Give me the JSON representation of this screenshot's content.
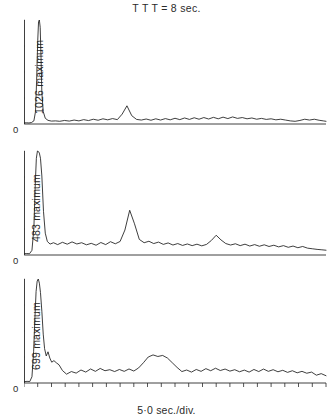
{
  "figure": {
    "title": "T T T = 8 sec.",
    "xlabel": "5·0 sec./div.",
    "zero_label": "0",
    "line_color": "#1c1c1c",
    "background_color": "#ffffff",
    "axis_color": "#2a2a2a"
  },
  "panels": [
    {
      "ylabel": "1026 maximum",
      "maximum": 1026,
      "zero_label": "0"
    },
    {
      "ylabel": "483 maximum",
      "maximum": 483,
      "zero_label": "0"
    },
    {
      "ylabel": "699 maximum",
      "maximum": 699,
      "zero_label": "0"
    }
  ],
  "chart_data": {
    "type": "line",
    "title": "T T T = 8 sec.",
    "xlabel": "5·0 sec./div.",
    "ylabel": "maximum",
    "grid": false,
    "legend": "none",
    "x_tick_interval_seconds": 5.0,
    "x_axis_ticks": 22,
    "y_axis_ticks": 5,
    "xlim": [
      0,
      22
    ],
    "ylim": [
      0,
      1
    ],
    "note": "Three stacked traces; y values normalised 0-1 of each panel maximum",
    "series": [
      {
        "name": "1026 maximum",
        "maximum": 1026,
        "ylabel": "1026 maximum",
        "x": [
          0.0,
          0.18,
          0.36,
          0.54,
          0.72,
          0.84,
          0.92,
          1.0,
          1.06,
          1.12,
          1.18,
          1.24,
          1.3,
          1.4,
          1.55,
          1.75,
          2.0,
          2.3,
          2.6,
          2.95,
          3.3,
          3.65,
          4.0,
          4.35,
          4.7,
          5.05,
          5.4,
          5.75,
          6.1,
          6.45,
          6.8,
          7.15,
          7.5,
          7.85,
          8.2,
          8.55,
          8.9,
          9.25,
          9.6,
          9.95,
          10.3,
          10.65,
          11.0,
          11.35,
          11.7,
          12.05,
          12.4,
          12.75,
          13.1,
          13.45,
          13.8,
          14.15,
          14.5,
          14.85,
          15.2,
          15.55,
          15.9,
          16.25,
          16.6,
          16.95,
          17.3,
          17.65,
          18.0,
          18.35,
          18.7,
          19.05,
          19.4,
          19.75,
          20.1,
          20.45,
          20.8,
          21.15,
          21.5,
          21.8,
          22.0
        ],
        "y": [
          0.01,
          0.012,
          0.01,
          0.014,
          0.03,
          0.12,
          0.42,
          0.8,
          0.985,
          1.0,
          0.93,
          0.64,
          0.3,
          0.12,
          0.055,
          0.035,
          0.028,
          0.03,
          0.026,
          0.034,
          0.028,
          0.038,
          0.03,
          0.042,
          0.033,
          0.046,
          0.036,
          0.05,
          0.04,
          0.052,
          0.042,
          0.095,
          0.175,
          0.08,
          0.044,
          0.038,
          0.048,
          0.036,
          0.05,
          0.038,
          0.052,
          0.04,
          0.055,
          0.042,
          0.058,
          0.044,
          0.06,
          0.046,
          0.062,
          0.048,
          0.064,
          0.05,
          0.066,
          0.052,
          0.068,
          0.054,
          0.062,
          0.05,
          0.058,
          0.046,
          0.054,
          0.044,
          0.05,
          0.04,
          0.046,
          0.038,
          0.03,
          0.026,
          0.034,
          0.046,
          0.038,
          0.046,
          0.036,
          0.03,
          0.026
        ]
      },
      {
        "name": "483 maximum",
        "maximum": 483,
        "ylabel": "483 maximum",
        "x": [
          0.0,
          0.2,
          0.4,
          0.58,
          0.72,
          0.82,
          0.9,
          0.98,
          1.05,
          1.12,
          1.2,
          1.3,
          1.42,
          1.55,
          1.7,
          1.9,
          2.15,
          2.45,
          2.8,
          3.15,
          3.5,
          3.85,
          4.2,
          4.55,
          4.9,
          5.25,
          5.6,
          5.95,
          6.3,
          6.65,
          7.0,
          7.35,
          7.7,
          8.05,
          8.4,
          8.75,
          9.1,
          9.45,
          9.8,
          10.15,
          10.5,
          10.85,
          11.2,
          11.55,
          11.9,
          12.25,
          12.6,
          12.95,
          13.3,
          13.65,
          14.0,
          14.35,
          14.7,
          15.05,
          15.4,
          15.75,
          16.1,
          16.45,
          16.8,
          17.15,
          17.5,
          17.85,
          18.2,
          18.55,
          18.9,
          19.25,
          19.6,
          19.95,
          20.3,
          20.65,
          21.0,
          21.35,
          21.7,
          22.0
        ],
        "y": [
          0.012,
          0.014,
          0.012,
          0.045,
          0.26,
          0.68,
          0.93,
          1.0,
          0.995,
          0.98,
          0.93,
          0.76,
          0.42,
          0.21,
          0.13,
          0.105,
          0.118,
          0.1,
          0.122,
          0.104,
          0.126,
          0.106,
          0.118,
          0.098,
          0.112,
          0.094,
          0.12,
          0.1,
          0.128,
          0.108,
          0.13,
          0.24,
          0.43,
          0.3,
          0.15,
          0.118,
          0.132,
          0.11,
          0.124,
          0.102,
          0.116,
          0.096,
          0.11,
          0.092,
          0.106,
          0.09,
          0.104,
          0.088,
          0.102,
          0.14,
          0.19,
          0.145,
          0.11,
          0.096,
          0.108,
          0.09,
          0.104,
          0.086,
          0.1,
          0.084,
          0.098,
          0.082,
          0.094,
          0.078,
          0.09,
          0.074,
          0.086,
          0.07,
          0.082,
          0.066,
          0.06,
          0.054,
          0.05,
          0.046
        ]
      },
      {
        "name": "699 maximum",
        "maximum": 699,
        "ylabel": "699 maximum",
        "x": [
          0.0,
          0.22,
          0.42,
          0.58,
          0.7,
          0.8,
          0.88,
          0.96,
          1.04,
          1.12,
          1.2,
          1.3,
          1.4,
          1.5,
          1.62,
          1.75,
          1.88,
          2.02,
          2.18,
          2.35,
          2.55,
          2.8,
          3.1,
          3.45,
          3.8,
          4.15,
          4.5,
          4.85,
          5.2,
          5.55,
          5.9,
          6.25,
          6.6,
          6.95,
          7.3,
          7.65,
          8.0,
          8.35,
          8.7,
          9.05,
          9.4,
          9.75,
          10.1,
          10.45,
          10.8,
          11.15,
          11.5,
          11.85,
          12.2,
          12.55,
          12.9,
          13.25,
          13.6,
          13.95,
          14.3,
          14.65,
          15.0,
          15.35,
          15.7,
          16.05,
          16.4,
          16.75,
          17.1,
          17.45,
          17.8,
          18.15,
          18.5,
          18.85,
          19.2,
          19.55,
          19.9,
          20.25,
          20.6,
          20.95,
          21.3,
          21.65,
          22.0
        ],
        "y": [
          0.012,
          0.016,
          0.014,
          0.06,
          0.3,
          0.64,
          0.88,
          0.98,
          1.0,
          0.96,
          0.87,
          0.69,
          0.47,
          0.33,
          0.26,
          0.3,
          0.24,
          0.2,
          0.215,
          0.195,
          0.175,
          0.12,
          0.085,
          0.11,
          0.095,
          0.125,
          0.105,
          0.135,
          0.112,
          0.14,
          0.118,
          0.128,
          0.11,
          0.13,
          0.112,
          0.135,
          0.115,
          0.145,
          0.195,
          0.25,
          0.27,
          0.255,
          0.265,
          0.24,
          0.195,
          0.15,
          0.11,
          0.125,
          0.105,
          0.13,
          0.112,
          0.138,
          0.118,
          0.142,
          0.12,
          0.134,
          0.114,
          0.128,
          0.108,
          0.124,
          0.105,
          0.13,
          0.11,
          0.134,
          0.112,
          0.128,
          0.108,
          0.122,
          0.102,
          0.118,
          0.098,
          0.112,
          0.094,
          0.105,
          0.075,
          0.09,
          0.07
        ]
      }
    ]
  }
}
